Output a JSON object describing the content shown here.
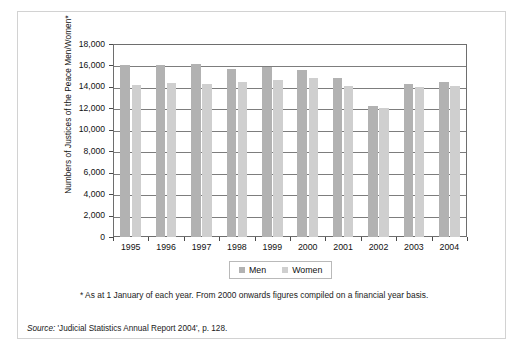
{
  "chart_data": {
    "type": "bar",
    "title": "",
    "categories": [
      "1995",
      "1996",
      "1997",
      "1998",
      "1999",
      "2000",
      "2001",
      "2002",
      "2003",
      "2004"
    ],
    "series": [
      {
        "name": "Men",
        "values": [
          16000,
          16000,
          16100,
          15700,
          15900,
          15600,
          14800,
          12200,
          14300,
          14500
        ]
      },
      {
        "name": "Women",
        "values": [
          14200,
          14400,
          14300,
          14500,
          14600,
          14800,
          14100,
          12000,
          14000,
          14100
        ]
      }
    ],
    "xlabel": "",
    "ylabel": "Numbers of Justices of the Peace Men/Women*",
    "ylim": [
      0,
      18000
    ],
    "ytick_labels": [
      "0",
      "2,000",
      "4,000",
      "6,000",
      "8,000",
      "10,000",
      "12,000",
      "14,000",
      "16,000",
      "18,000"
    ],
    "ytick_values": [
      0,
      2000,
      4000,
      6000,
      8000,
      10000,
      12000,
      14000,
      16000,
      18000
    ],
    "grid": true,
    "legend_position": "bottom-center",
    "colors": {
      "men": "#b2b2b2",
      "women": "#cfcfcf",
      "axis": "#6e6e6e",
      "grid": "#7d7d7d",
      "frame": "#d2d2d2",
      "text": "#1a1a1a"
    }
  },
  "legend": {
    "entries": [
      {
        "label": "Men"
      },
      {
        "label": "Women"
      }
    ]
  },
  "footnote": {
    "text": "* As at 1 January of each year. From 2000 onwards figures compiled on a financial year basis."
  },
  "source": {
    "label": "Source:",
    "text": "'Judicial Statistics Annual Report 2004', p. 128."
  }
}
